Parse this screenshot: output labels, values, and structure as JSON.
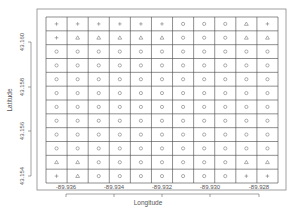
{
  "chart_data": {
    "type": "scatter",
    "title": "",
    "xlabel": "Longitude",
    "ylabel": "Latitude",
    "x_ticks": [
      "-89.936",
      "-89.934",
      "-89.932",
      "-89.930",
      "-89.928"
    ],
    "y_ticks": [
      "43.154",
      "43.156",
      "43.158",
      "43.160"
    ],
    "grid": {
      "rows": 12,
      "cols": 11
    },
    "symbols_legend": {
      "+": "plus",
      "^": "triangle",
      "o": "circle"
    },
    "cells": [
      [
        "+",
        "+",
        "+",
        "+",
        "+",
        "+",
        "o",
        "o",
        "o",
        "^",
        "+"
      ],
      [
        "+",
        "^",
        "^",
        "^",
        "^",
        "^",
        "o",
        "o",
        "o",
        "^",
        "^"
      ],
      [
        "o",
        "o",
        "o",
        "o",
        "o",
        "o",
        "o",
        "o",
        "o",
        "o",
        "o"
      ],
      [
        "o",
        "o",
        "o",
        "o",
        "o",
        "o",
        "o",
        "o",
        "o",
        "o",
        "o"
      ],
      [
        "o",
        "o",
        "o",
        "o",
        "o",
        "o",
        "o",
        "o",
        "o",
        "o",
        "o"
      ],
      [
        "o",
        "o",
        "o",
        "o",
        "o",
        "o",
        "o",
        "o",
        "o",
        "o",
        "o"
      ],
      [
        "o",
        "o",
        "o",
        "o",
        "o",
        "o",
        "o",
        "o",
        "o",
        "o",
        "o"
      ],
      [
        "o",
        "o",
        "o",
        "o",
        "o",
        "o",
        "o",
        "o",
        "o",
        "o",
        "o"
      ],
      [
        "o",
        "o",
        "o",
        "o",
        "o",
        "o",
        "o",
        "o",
        "o",
        "o",
        "o"
      ],
      [
        "o",
        "o",
        "o",
        "o",
        "o",
        "o",
        "o",
        "o",
        "o",
        "o",
        "o"
      ],
      [
        "^",
        "^",
        "o",
        "o",
        "o",
        "o",
        "o",
        "o",
        "o",
        "^",
        "^"
      ],
      [
        "+",
        "^",
        "o",
        "o",
        "o",
        "o",
        "o",
        "o",
        "o",
        "+",
        "+"
      ]
    ]
  },
  "colors": {
    "line": "#555555",
    "symbol": "#777777",
    "background": "#ffffff"
  }
}
